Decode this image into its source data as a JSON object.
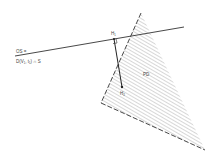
{
  "diagram": {
    "labels": {
      "os_line1": "OS =",
      "os_line2": "D(V₁, t₁) ∩ S",
      "h1": "H₁",
      "h2": "H₂",
      "region": "PD"
    },
    "colors": {
      "stroke": "#333333",
      "hatch": "#9a9a9a",
      "text": "#444444"
    },
    "geometry": {
      "line": {
        "x1": 15,
        "y1": 56,
        "x2": 184,
        "y2": 27
      },
      "triangle": [
        [
          141,
          13
        ],
        [
          101,
          103
        ],
        [
          205,
          150
        ]
      ],
      "h1": [
        114,
        39
      ],
      "h2": [
        122,
        87
      ]
    }
  }
}
